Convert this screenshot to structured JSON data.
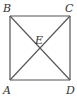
{
  "diagram": {
    "shape": "square",
    "stroke_color": "#555555",
    "label_color": "#333333",
    "vertices": {
      "B": {
        "label": "B",
        "x": 10,
        "y": 16
      },
      "C": {
        "label": "C",
        "x": 70,
        "y": 16
      },
      "A": {
        "label": "A",
        "x": 10,
        "y": 80
      },
      "D": {
        "label": "D",
        "x": 70,
        "y": 80
      }
    },
    "intersection": {
      "label": "E",
      "x": 40,
      "y": 48
    },
    "segments": [
      "AB",
      "BC",
      "CD",
      "DA",
      "AC",
      "BD"
    ]
  }
}
